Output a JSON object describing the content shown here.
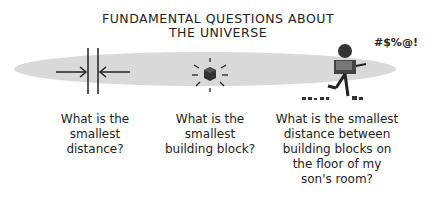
{
  "title": {
    "line1": "FUNDAMENTAL QUESTIONS ABOUT",
    "line2": "THE UNIVERSE"
  },
  "exclamation": "#$%@!",
  "panels": [
    {
      "icon": "distance-arrows-icon",
      "lines": [
        "What is the",
        "smallest",
        "distance?"
      ]
    },
    {
      "icon": "glowing-cube-icon",
      "lines": [
        "What is the",
        "smallest",
        "building block?"
      ]
    },
    {
      "icon": "man-stepping-on-blocks-icon",
      "lines": [
        "What is the smallest",
        "distance between",
        "building blocks on",
        "the floor of my",
        "son's room?"
      ]
    }
  ],
  "colors": {
    "band": "#d9d9d9",
    "ink": "#222222",
    "background": "#ffffff"
  }
}
